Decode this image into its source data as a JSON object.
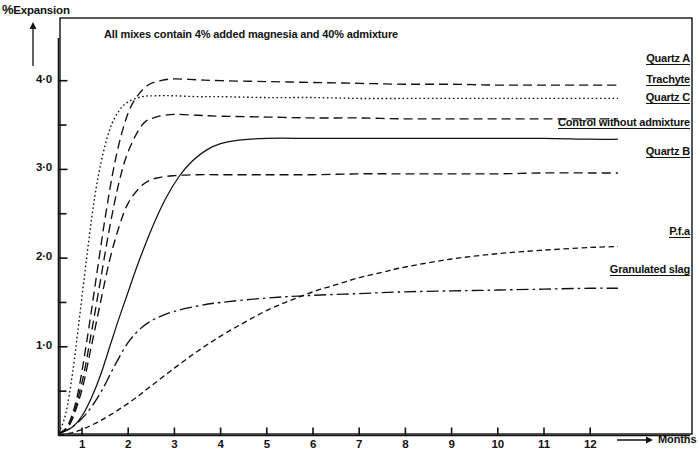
{
  "figure": {
    "y_axis_title": "% Expansion",
    "y_axis_title_pct": "%",
    "y_axis_title_rest": "Expansion",
    "annotation": "All mixes contain 4% added magnesia and 40% admixture",
    "x_axis_title": "Months"
  },
  "axes": {
    "y_ticks_major": [
      "1·0",
      "2·0",
      "3·0",
      "4·0"
    ],
    "x_ticks": [
      "1",
      "2",
      "3",
      "4",
      "5",
      "6",
      "7",
      "8",
      "9",
      "10",
      "11",
      "12"
    ]
  },
  "labels": {
    "quartz_a": "Quartz A",
    "trachyte": "Trachyte",
    "quartz_c": "Quartz C",
    "control": "Control without admixture",
    "quartz_b": "Quartz B",
    "pfa": "P.f.a",
    "slag": "Granulated slag"
  },
  "chart_data": {
    "type": "line",
    "title": "",
    "subtitle": "All mixes contain 4% added magnesia and 40% admixture",
    "xlabel": "Months",
    "ylabel": "% Expansion",
    "xlim": [
      0.5,
      12.6
    ],
    "ylim": [
      0.0,
      4.3
    ],
    "grid": false,
    "legend_position": "right-inline-labels",
    "x_ticks": [
      1,
      2,
      3,
      4,
      5,
      6,
      7,
      8,
      9,
      10,
      11,
      12
    ],
    "y_ticks_major": [
      1.0,
      2.0,
      3.0,
      4.0
    ],
    "y_ticks_minor": [
      0.5,
      1.5,
      2.5,
      3.5
    ],
    "series": [
      {
        "name": "Quartz A",
        "linestyle": "dashed",
        "color": "#111111",
        "dash_pattern": "9,5",
        "x": [
          0.5,
          0.7,
          0.9,
          1.1,
          1.3,
          1.5,
          1.7,
          1.9,
          2.1,
          2.4,
          2.7,
          3.0,
          3.5,
          4.0,
          5.0,
          6.0,
          7.0,
          8.0,
          9.0,
          10.0,
          11.0,
          12.0,
          12.6
        ],
        "y": [
          0.02,
          0.12,
          0.45,
          1.05,
          1.75,
          2.45,
          3.05,
          3.48,
          3.75,
          3.94,
          4.0,
          4.02,
          4.01,
          4.0,
          3.99,
          3.98,
          3.97,
          3.96,
          3.96,
          3.95,
          3.95,
          3.95,
          3.95
        ]
      },
      {
        "name": "Trachyte",
        "linestyle": "dotted",
        "color": "#111111",
        "dash_pattern": "1.6,2.6",
        "x": [
          0.5,
          0.65,
          0.8,
          0.95,
          1.1,
          1.25,
          1.4,
          1.6,
          1.8,
          2.0,
          2.3,
          2.6,
          3.0,
          3.5,
          4.0,
          5.0,
          6.0,
          7.0,
          8.0,
          9.0,
          10.0,
          11.0,
          12.0,
          12.6
        ],
        "y": [
          0.03,
          0.25,
          0.72,
          1.35,
          2.0,
          2.6,
          3.05,
          3.45,
          3.66,
          3.76,
          3.82,
          3.83,
          3.83,
          3.82,
          3.82,
          3.81,
          3.81,
          3.8,
          3.8,
          3.8,
          3.8,
          3.8,
          3.8,
          3.8
        ]
      },
      {
        "name": "Quartz C",
        "linestyle": "dashed",
        "color": "#111111",
        "dash_pattern": "9,5",
        "x": [
          0.5,
          0.75,
          1.0,
          1.2,
          1.4,
          1.6,
          1.8,
          2.0,
          2.3,
          2.6,
          3.0,
          3.5,
          4.0,
          5.0,
          6.0,
          7.0,
          8.0,
          9.0,
          10.0,
          11.0,
          12.0,
          12.6
        ],
        "y": [
          0.02,
          0.15,
          0.6,
          1.15,
          1.75,
          2.35,
          2.85,
          3.2,
          3.5,
          3.59,
          3.62,
          3.61,
          3.6,
          3.59,
          3.58,
          3.58,
          3.57,
          3.57,
          3.57,
          3.57,
          3.57,
          3.57
        ]
      },
      {
        "name": "Control without admixture",
        "linestyle": "solid",
        "color": "#111111",
        "dash_pattern": "none",
        "x": [
          0.5,
          0.8,
          1.0,
          1.2,
          1.4,
          1.6,
          1.8,
          2.0,
          2.2,
          2.5,
          2.8,
          3.1,
          3.4,
          3.7,
          4.0,
          4.4,
          5.0,
          6.0,
          7.0,
          8.0,
          9.0,
          10.0,
          11.0,
          12.0,
          12.6
        ],
        "y": [
          0.02,
          0.1,
          0.22,
          0.42,
          0.68,
          1.0,
          1.32,
          1.62,
          1.92,
          2.32,
          2.66,
          2.92,
          3.1,
          3.22,
          3.29,
          3.33,
          3.35,
          3.35,
          3.35,
          3.35,
          3.35,
          3.35,
          3.35,
          3.34,
          3.34
        ]
      },
      {
        "name": "Quartz B",
        "linestyle": "dashed",
        "color": "#111111",
        "dash_pattern": "9,5",
        "x": [
          0.5,
          0.75,
          1.0,
          1.2,
          1.4,
          1.6,
          1.8,
          2.0,
          2.3,
          2.6,
          3.0,
          3.5,
          4.0,
          5.0,
          6.0,
          7.0,
          8.0,
          9.0,
          10.0,
          11.0,
          12.0,
          12.6
        ],
        "y": [
          0.02,
          0.14,
          0.52,
          1.0,
          1.5,
          1.98,
          2.35,
          2.62,
          2.82,
          2.9,
          2.93,
          2.94,
          2.94,
          2.94,
          2.94,
          2.95,
          2.95,
          2.95,
          2.95,
          2.96,
          2.96,
          2.96
        ]
      },
      {
        "name": "Granulated slag",
        "linestyle": "dash-dot",
        "color": "#111111",
        "dash_pattern": "12,4,2.5,4",
        "x": [
          0.5,
          0.8,
          1.1,
          1.4,
          1.7,
          2.0,
          2.3,
          2.6,
          3.0,
          3.5,
          4.0,
          5.0,
          6.0,
          7.0,
          8.0,
          9.0,
          10.0,
          11.0,
          12.0,
          12.6
        ],
        "y": [
          0.02,
          0.1,
          0.25,
          0.48,
          0.78,
          1.05,
          1.22,
          1.32,
          1.4,
          1.46,
          1.5,
          1.55,
          1.58,
          1.6,
          1.62,
          1.63,
          1.64,
          1.65,
          1.66,
          1.66
        ]
      },
      {
        "name": "P.f.a",
        "linestyle": "dashed-fine",
        "color": "#111111",
        "dash_pattern": "5.5,3.5",
        "x": [
          0.5,
          0.9,
          1.3,
          1.7,
          2.1,
          2.5,
          3.0,
          3.5,
          4.0,
          4.5,
          5.0,
          5.5,
          6.0,
          6.5,
          7.0,
          7.5,
          8.0,
          9.0,
          10.0,
          11.0,
          12.0,
          12.6
        ],
        "y": [
          0.0,
          0.05,
          0.14,
          0.26,
          0.4,
          0.56,
          0.76,
          0.95,
          1.12,
          1.27,
          1.41,
          1.52,
          1.62,
          1.7,
          1.78,
          1.84,
          1.9,
          1.99,
          2.05,
          2.09,
          2.12,
          2.13
        ]
      }
    ]
  }
}
